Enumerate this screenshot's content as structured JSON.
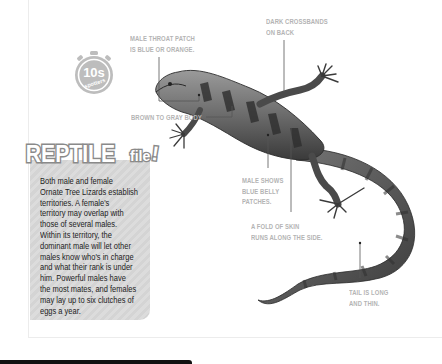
{
  "badge": {
    "number": "10s",
    "caption": "spotters",
    "icon": "stopwatch-icon"
  },
  "reptile_file": {
    "title_main": "REPTILE",
    "title_sub": "file",
    "title_mark": "!",
    "lines": [
      "Both male and female",
      "Ornate Tree Lizards establish",
      "territories. A female's",
      "territory may overlap with",
      "those of several males.",
      "Within its territory, the",
      "dominant male will let other",
      "males know who's in charge",
      "and what their rank is under",
      "him. Powerful males have",
      "the most mates, and females",
      "may lay up to six clutches of",
      "eggs a year."
    ]
  },
  "annotations": {
    "throat": [
      "MALE THROAT PATCH",
      "IS BLUE OR ORANGE."
    ],
    "crossbands": [
      "DARK CROSSBANDS",
      "ON BACK"
    ],
    "body": [
      "BROWN TO GRAY BODY"
    ],
    "belly": [
      "MALE SHOWS",
      "BLUE BELLY",
      "PATCHES."
    ],
    "skin_fold": [
      "A FOLD OF SKIN",
      "RUNS ALONG THE SIDE."
    ],
    "tail": [
      "TAIL IS LONG",
      "AND THIN."
    ]
  },
  "illustration": {
    "subject": "ornate-tree-lizard"
  },
  "colors": {
    "label_gray": "#b4b4b4",
    "panel_gray": "#d8d8d8",
    "title_fill": "#ffffff",
    "title_stroke": "#8a8a8a",
    "text_dark": "#222222",
    "bottom_bar": "#111111"
  }
}
